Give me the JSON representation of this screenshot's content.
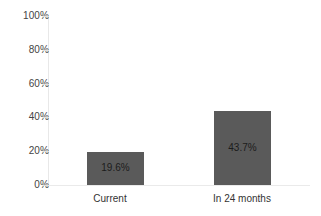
{
  "chart_data": {
    "type": "bar",
    "title": "",
    "subtitle": "",
    "xlabel": "",
    "ylabel": "",
    "categories": [
      "Current",
      "In 24 months"
    ],
    "values": [
      19.6,
      43.7
    ],
    "data_labels": [
      "19.6%",
      "43.7%"
    ],
    "ylim": [
      0,
      100
    ],
    "y_ticks": [
      0,
      20,
      40,
      60,
      80,
      100
    ],
    "y_tick_labels": [
      "0%",
      "20%",
      "40%",
      "60%",
      "80%",
      "100%"
    ],
    "grid": false,
    "legend": null,
    "legend_position": "none",
    "series": [
      {
        "name": "",
        "values": [
          19.6,
          43.7
        ]
      }
    ],
    "colors": {
      "bar_fill": "#5a5a5a",
      "data_label_text": "#1c1c1c",
      "tick_label_text": "#444444",
      "category_label_text": "#333333",
      "axis_line": "#e8e8e8",
      "background": "#ffffff"
    }
  }
}
